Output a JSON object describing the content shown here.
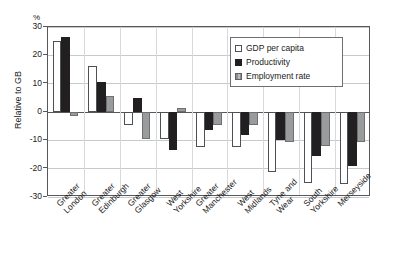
{
  "chart_data": {
    "type": "bar",
    "title": "",
    "subtitle": "",
    "xlabel": "",
    "ylabel": "Relative to GB",
    "unit_label": "%",
    "ylim": [
      -30,
      30
    ],
    "yticks": [
      30,
      20,
      10,
      0,
      -10,
      -20,
      -30
    ],
    "ytick_labels": [
      "30",
      "20",
      "10",
      "0",
      "-10",
      "-20",
      "-30"
    ],
    "grid": true,
    "legend_position": "top-right",
    "categories": [
      "Greater\nLondon",
      "Greater\nEdinburgh",
      "Greater\nGlasgow",
      "West\nYorkshire",
      "Greater\nManchester",
      "West\nMidlands",
      "Tyne and\nWear",
      "South\nYorkshire",
      "Merseyside"
    ],
    "series": [
      {
        "name": "GDP per capita",
        "color": "#ffffff",
        "values": [
          25.2,
          16.1,
          -4.5,
          -9.5,
          -12.5,
          -12.5,
          -21.0,
          -25.0,
          -25.5
        ]
      },
      {
        "name": "Productivity",
        "color": "#221f20",
        "values": [
          26.3,
          10.5,
          5.0,
          -13.5,
          -6.5,
          -8.0,
          -10.0,
          -15.5,
          -19.0
        ]
      },
      {
        "name": "Employment rate",
        "color": "#9a9b9d",
        "values": [
          -1.5,
          5.5,
          -9.5,
          1.5,
          -4.5,
          -4.5,
          -10.5,
          -12.0,
          -10.5
        ]
      }
    ]
  },
  "legend": {
    "items": [
      {
        "label": "GDP per capita"
      },
      {
        "label": "Productivity"
      },
      {
        "label": "Employment rate"
      }
    ]
  }
}
